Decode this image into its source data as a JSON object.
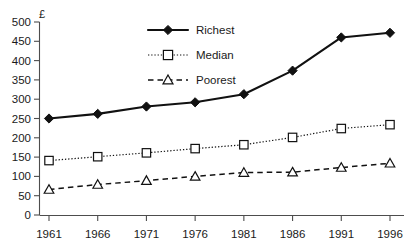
{
  "chart_data": {
    "type": "line",
    "title": "",
    "subtitle": "",
    "xlabel": "",
    "ylabel": "",
    "y_unit_symbol": "£",
    "categories": [
      "1961",
      "1966",
      "1971",
      "1976",
      "1981",
      "1986",
      "1991",
      "1996"
    ],
    "x": [
      1961,
      1966,
      1971,
      1976,
      1981,
      1986,
      1991,
      1996
    ],
    "series": [
      {
        "name": "Richest",
        "marker": "filled-diamond",
        "line_style": "solid",
        "values": [
          250,
          262,
          281,
          292,
          313,
          374,
          460,
          472
        ]
      },
      {
        "name": "Median",
        "marker": "open-square",
        "line_style": "dotted",
        "values": [
          141,
          151,
          161,
          172,
          182,
          201,
          224,
          234
        ]
      },
      {
        "name": "Poorest",
        "marker": "open-triangle",
        "line_style": "dashed",
        "values": [
          66,
          79,
          89,
          100,
          110,
          111,
          123,
          134
        ]
      }
    ],
    "ylim": [
      0,
      500
    ],
    "xlim": [
      1961,
      1996
    ],
    "y_ticks": [
      0,
      50,
      100,
      150,
      200,
      250,
      300,
      350,
      400,
      450,
      500
    ],
    "y_tick_labels": [
      "0",
      "50",
      "100",
      "150",
      "200",
      "250",
      "300",
      "350",
      "400",
      "450",
      "500"
    ],
    "x_ticks": [
      1961,
      1966,
      1971,
      1976,
      1981,
      1986,
      1991,
      1996
    ],
    "x_tick_labels": [
      "1961",
      "1966",
      "1971",
      "1976",
      "1981",
      "1986",
      "1991",
      "1996"
    ],
    "grid": false,
    "legend_position": "top-center",
    "legend_entries": [
      "Richest",
      "Median",
      "Poorest"
    ],
    "annotations": []
  },
  "axis": {
    "unit_symbol": "£"
  },
  "legend": {
    "items": [
      {
        "label": "Richest"
      },
      {
        "label": "Median"
      },
      {
        "label": "Poorest"
      }
    ]
  }
}
